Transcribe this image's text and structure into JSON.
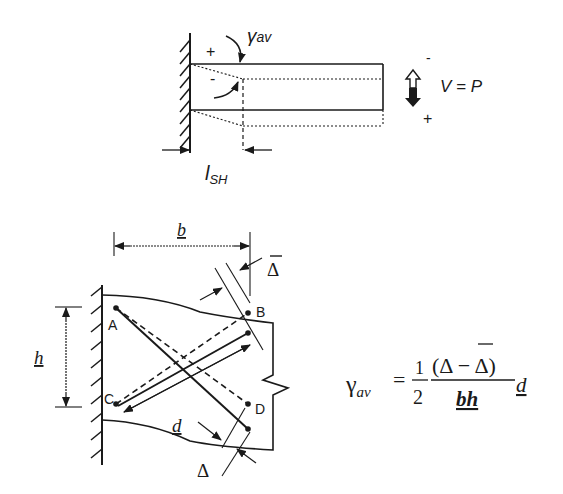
{
  "top_diagram": {
    "gamma_label": "γ",
    "gamma_sub": "av",
    "plus_sign": "+",
    "minus_sign": "-",
    "length_label": "l",
    "length_sub": "SH",
    "shear_label": "V = P",
    "shear_minus": "-",
    "shear_plus": "+"
  },
  "bottom_diagram": {
    "width_label": "b",
    "height_label": "h",
    "diag_label": "d",
    "delta_bar_label": "Δ",
    "delta_label": "Δ",
    "points": [
      "A",
      "B",
      "C",
      "D"
    ]
  },
  "formula": {
    "lhs": "γ",
    "lhs_sub": "av",
    "equals": "=",
    "frac1_num": "1",
    "frac1_den": "2",
    "frac2_num": "(Δ − Δ)",
    "frac2_den": "bh",
    "trailing": "d"
  },
  "colors": {
    "ink": "#1a1a1a",
    "background": "#ffffff"
  }
}
